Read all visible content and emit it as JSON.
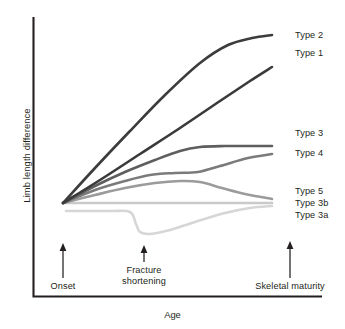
{
  "chart_data": {
    "type": "line",
    "title": "",
    "xlabel": "Age",
    "ylabel": "Limb length difference",
    "grid": false,
    "legend_position": "right-inline-end-of-line",
    "x_axis": {
      "label": "Age",
      "ticks": [],
      "range_markers": [
        "Onset",
        "Fracture shortening",
        "Skeletal maturity"
      ]
    },
    "y_axis": {
      "label": "Limb length difference",
      "ticks": [],
      "range": [
        0,
        1
      ]
    },
    "annotations": [
      {
        "name": "onset",
        "label": "Onset",
        "x_fraction": 0.13,
        "arrow": "up"
      },
      {
        "name": "fracture-shortening",
        "label_line1": "Fracture",
        "label_line2": "shortening",
        "x_fraction": 0.43,
        "arrow": "up"
      },
      {
        "name": "skeletal-maturity",
        "label": "Skeletal maturity",
        "x_fraction": 0.89,
        "arrow": "up"
      }
    ],
    "series": [
      {
        "name": "Type 2",
        "label": "Type 2",
        "color": "#3c3c3c",
        "width": 2.6,
        "description": "steep rise from onset, decelerating and flattening before skeletal maturity",
        "points": [
          [
            63,
            203
          ],
          [
            95,
            168
          ],
          [
            130,
            131
          ],
          [
            165,
            95
          ],
          [
            200,
            63
          ],
          [
            228,
            45
          ],
          [
            252,
            38
          ],
          [
            272,
            35
          ]
        ]
      },
      {
        "name": "Type 1",
        "label": "Type 1",
        "color": "#3a3a3a",
        "width": 2.6,
        "description": "steady straight-line increase to skeletal maturity",
        "points": [
          [
            63,
            203
          ],
          [
            100,
            180
          ],
          [
            140,
            154
          ],
          [
            180,
            128
          ],
          [
            220,
            101
          ],
          [
            250,
            81
          ],
          [
            272,
            67
          ]
        ]
      },
      {
        "name": "Type 3",
        "label": "Type 3",
        "color": "#5e5e5e",
        "width": 2.6,
        "description": "rises then plateaus flat at moderate difference",
        "points": [
          [
            63,
            203
          ],
          [
            95,
            186
          ],
          [
            125,
            172
          ],
          [
            155,
            160
          ],
          [
            180,
            151
          ],
          [
            200,
            147
          ],
          [
            225,
            146
          ],
          [
            250,
            146
          ],
          [
            272,
            146
          ]
        ]
      },
      {
        "name": "Type 4",
        "label": "Type 4",
        "color": "#7b7b7b",
        "width": 2.6,
        "description": "rises, plateaus mid-course, then rises again near skeletal maturity",
        "points": [
          [
            63,
            203
          ],
          [
            95,
            190
          ],
          [
            125,
            181
          ],
          [
            150,
            175
          ],
          [
            175,
            173
          ],
          [
            198,
            172
          ],
          [
            220,
            166
          ],
          [
            248,
            158
          ],
          [
            272,
            154
          ]
        ]
      },
      {
        "name": "Type 5",
        "label": "Type 5",
        "color": "#9b9b9b",
        "width": 2.6,
        "description": "rises to a hump then declines back toward baseline",
        "points": [
          [
            63,
            203
          ],
          [
            95,
            195
          ],
          [
            125,
            188
          ],
          [
            155,
            183
          ],
          [
            180,
            181
          ],
          [
            200,
            182
          ],
          [
            222,
            188
          ],
          [
            245,
            194
          ],
          [
            272,
            199
          ]
        ]
      },
      {
        "name": "Type 3b",
        "label": "Type 3b",
        "color": "#c9c9c9",
        "width": 2.6,
        "description": "flat horizontal, no change in limb length difference",
        "points": [
          [
            63,
            203
          ],
          [
            120,
            203
          ],
          [
            180,
            203
          ],
          [
            230,
            203
          ],
          [
            272,
            203
          ]
        ]
      },
      {
        "name": "Type 3a",
        "label": "Type 3a",
        "color": "#d6d6d6",
        "width": 2.6,
        "description": "flat, sharp drop at fracture shortening, then gradual recovery toward baseline",
        "points": [
          [
            66,
            211
          ],
          [
            110,
            211
          ],
          [
            130,
            212
          ],
          [
            136,
            224
          ],
          [
            140,
            232
          ],
          [
            150,
            234
          ],
          [
            170,
            230
          ],
          [
            195,
            222
          ],
          [
            225,
            213
          ],
          [
            250,
            208
          ],
          [
            272,
            206
          ]
        ]
      }
    ]
  },
  "labels": {
    "type2": "Type 2",
    "type1": "Type 1",
    "type3": "Type 3",
    "type4": "Type 4",
    "type5": "Type 5",
    "type3b": "Type 3b",
    "type3a": "Type 3a",
    "onset": "Onset",
    "fracture_line1": "Fracture",
    "fracture_line2": "shortening",
    "skeletal_maturity": "Skeletal maturity",
    "xlabel": "Age",
    "ylabel": "Limb length difference"
  }
}
